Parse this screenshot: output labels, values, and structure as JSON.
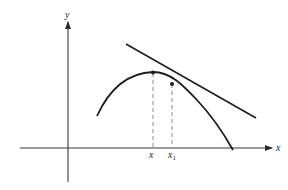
{
  "diagram": {
    "axes": {
      "x_label": "x",
      "y_label": "y"
    },
    "points": [
      {
        "label": "x",
        "sub": ""
      },
      {
        "label": "x",
        "sub": "1"
      }
    ],
    "elements": [
      "curve",
      "tangent-line",
      "dashed-drop-lines",
      "axes-with-arrows"
    ],
    "colors": {
      "stroke": "#1e1e1e",
      "axis": "#3a3a3a",
      "dash": "#8a8a8a",
      "background": "#ffffff"
    }
  }
}
